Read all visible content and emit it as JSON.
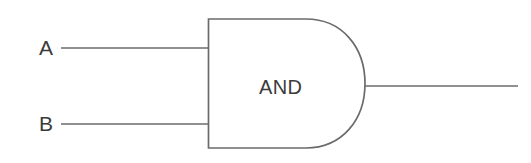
{
  "diagram": {
    "type": "logic-gate",
    "gate": {
      "kind": "AND",
      "body_label": "AND",
      "shape": "d-shape"
    },
    "inputs": [
      {
        "label": "A",
        "name": "input-a",
        "wire": "input-wire-a"
      },
      {
        "label": "B",
        "name": "input-b",
        "wire": "input-wire-b"
      }
    ],
    "output": {
      "label": "",
      "name": "output",
      "wire": "output-wire"
    },
    "colors": {
      "background": "#ffffff",
      "stroke": "#6b6b6b",
      "text": "#3b3b3b"
    },
    "geometry": {
      "body_left": 208,
      "body_top": 19,
      "body_bottom": 148,
      "body_straight_right": 310,
      "arc_tip_x": 365,
      "input_a_y": 48,
      "input_b_y": 124,
      "output_y": 86,
      "input_wire_start_x": 61,
      "output_wire_end_x": 518
    }
  }
}
